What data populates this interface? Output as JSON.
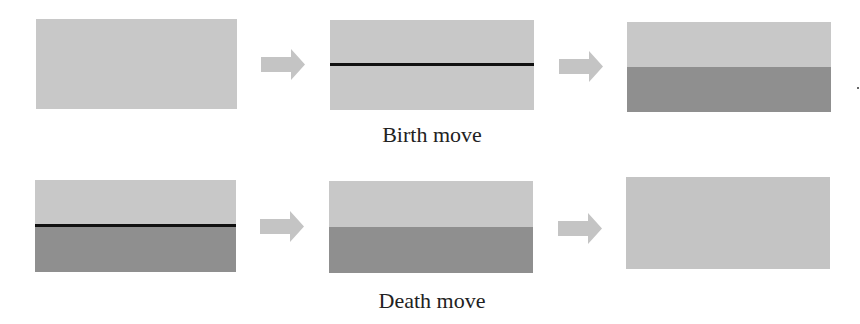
{
  "colors": {
    "light_fill": "#c8c8c8",
    "dark_fill": "#8f8f8f",
    "line": "#111111",
    "arrow": "#c4c4c4"
  },
  "rows": [
    {
      "caption": "Birth move",
      "panels": [
        {
          "state": "light-only"
        },
        {
          "state": "light-with-line"
        },
        {
          "state": "light-top-dark-bottom"
        }
      ]
    },
    {
      "caption": "Death move",
      "panels": [
        {
          "state": "light-top-line-dark-bottom"
        },
        {
          "state": "light-top-dark-bottom"
        },
        {
          "state": "light-only"
        }
      ]
    }
  ]
}
